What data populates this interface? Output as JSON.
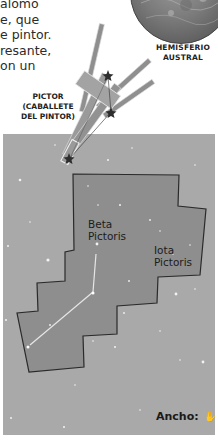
{
  "intro_text": {
    "lines": [
      "alomo",
      "e, que",
      "e pintor.",
      "resante,",
      "on un"
    ]
  },
  "globe": {
    "label_line1": "HEMISFERIO",
    "label_line2": "AUSTRAL"
  },
  "constellation": {
    "name_line1": "PICTOR",
    "name_line2": "(CABALLETE",
    "name_line3": "DEL PINTOR)"
  },
  "stars": {
    "beta_line1": "Beta",
    "beta_line2": "Pictoris",
    "iota_line1": "Iota",
    "iota_line2": "Pictoris"
  },
  "footer": {
    "width_label": "Ancho:",
    "hand_icon": "✋"
  },
  "colors": {
    "starfield": "#a9a9a9",
    "constellation_area": "#8e8e8e",
    "boundary": "#2a2a2a",
    "text": "#222222"
  }
}
